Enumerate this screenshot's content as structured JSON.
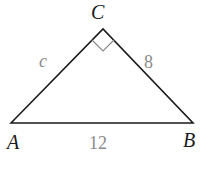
{
  "diagram": {
    "type": "right-triangle",
    "vertices": {
      "A": {
        "label": "A",
        "x": 11,
        "y": 123
      },
      "B": {
        "label": "B",
        "x": 193,
        "y": 123
      },
      "C": {
        "label": "C",
        "x": 103,
        "y": 29
      }
    },
    "sides": {
      "AC": {
        "label": "c"
      },
      "CB": {
        "label": "8"
      },
      "AB": {
        "label": "12"
      }
    },
    "right_angle_at": "C",
    "colors": {
      "stroke": "#1a1a1a",
      "side_label": "#8a8a8a",
      "right_angle_marker": "#8a8a8a"
    }
  }
}
